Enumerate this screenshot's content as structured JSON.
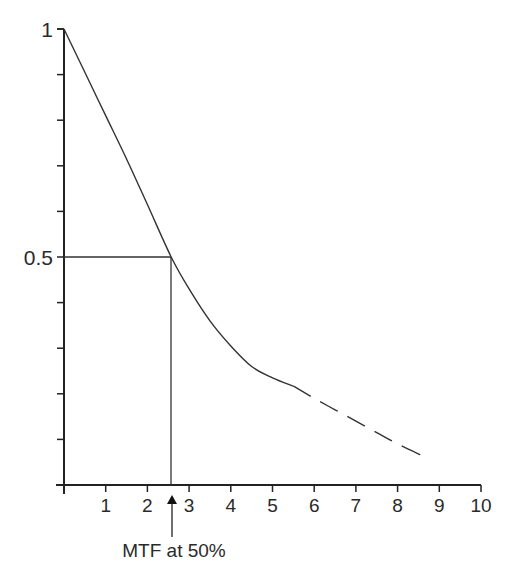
{
  "chart_data": {
    "type": "line",
    "title": "",
    "xlabel": "",
    "ylabel": "",
    "xlim": [
      0,
      10
    ],
    "ylim": [
      0,
      1
    ],
    "grid": false,
    "legend": null,
    "x_ticks": [
      1,
      2,
      3,
      4,
      5,
      6,
      7,
      8,
      9,
      10
    ],
    "x_tick_labels": [
      "1",
      "2",
      "3",
      "4",
      "5",
      "6",
      "7",
      "8",
      "9",
      "10"
    ],
    "y_ticks": [
      0.1,
      0.2,
      0.3,
      0.4,
      0.5,
      0.6,
      0.7,
      0.8,
      0.9,
      1.0
    ],
    "y_tick_labels": {
      "0.5": "0.5",
      "1": "1"
    },
    "series": [
      {
        "name": "MTF (measured)",
        "style": "solid",
        "x": [
          0,
          0.5,
          1.0,
          1.5,
          2.0,
          2.57,
          3.0,
          3.5,
          4.0,
          4.5,
          5.0,
          5.5
        ],
        "values": [
          1.0,
          0.905,
          0.81,
          0.715,
          0.615,
          0.5,
          0.43,
          0.36,
          0.305,
          0.26,
          0.235,
          0.217
        ]
      },
      {
        "name": "MTF (extrapolated)",
        "style": "dashed",
        "x": [
          5.5,
          6.0,
          6.5,
          7.0,
          7.5,
          8.0,
          8.6
        ],
        "values": [
          0.217,
          0.19,
          0.165,
          0.14,
          0.115,
          0.09,
          0.064
        ]
      }
    ],
    "reference_lines": [
      {
        "type": "horizontal",
        "y": 0.5,
        "x_from": 0,
        "x_to": 2.57
      },
      {
        "type": "vertical",
        "x": 2.57,
        "y_from": 0,
        "y_to": 0.5
      }
    ],
    "annotations": [
      {
        "text": "MTF at 50%",
        "x": 2.57,
        "arrow": "up",
        "position": "below x-axis"
      }
    ]
  },
  "labels": {
    "y_top": "1",
    "y_mid": "0.5",
    "annotation": "MTF at 50%",
    "x_ticks": [
      "1",
      "2",
      "3",
      "4",
      "5",
      "6",
      "7",
      "8",
      "9",
      "10"
    ]
  }
}
